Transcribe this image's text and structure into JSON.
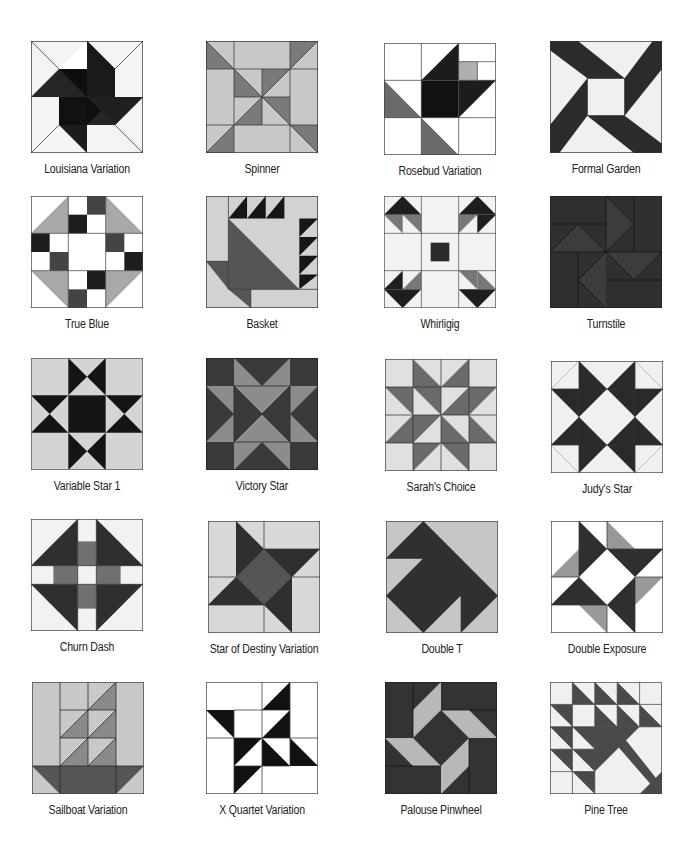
{
  "colors": {
    "black": "#151515",
    "dark": "#3a3a3a",
    "mid": "#6f6f6f",
    "light": "#a9a9a9",
    "pale": "#d6d6d6",
    "white": "#fafafa",
    "line": "#333333"
  },
  "blocks": [
    {
      "name": "Louisiana Variation"
    },
    {
      "name": "Spinner"
    },
    {
      "name": "Rosebud Variation"
    },
    {
      "name": "Formal Garden"
    },
    {
      "name": "True Blue"
    },
    {
      "name": "Basket"
    },
    {
      "name": "Whirligig"
    },
    {
      "name": "Turnstile"
    },
    {
      "name": "Variable Star 1"
    },
    {
      "name": "Victory Star"
    },
    {
      "name": "Sarah's Choice"
    },
    {
      "name": "Judy's Star"
    },
    {
      "name": "Churn Dash"
    },
    {
      "name": "Star of Destiny Variation"
    },
    {
      "name": "Double T"
    },
    {
      "name": "Double Exposure"
    },
    {
      "name": "Sailboat Variation"
    },
    {
      "name": "X Quartet Variation"
    },
    {
      "name": "Palouse Pinwheel"
    },
    {
      "name": "Pine Tree"
    }
  ]
}
